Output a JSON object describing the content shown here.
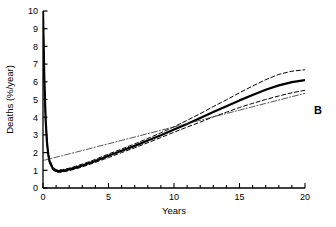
{
  "panel": {
    "label": "B"
  },
  "chart_data": {
    "type": "line",
    "title": "",
    "xlabel": "Years",
    "ylabel": "Deaths (%/year)",
    "xlim": [
      0,
      20
    ],
    "ylim": [
      0,
      10
    ],
    "grid": false,
    "legend_position": "none",
    "xticks": [
      0,
      5,
      10,
      15,
      20
    ],
    "xtick_labels": [
      "0",
      "5",
      "10",
      "15",
      "20"
    ],
    "xminor_tick_interval": 1,
    "yticks": [
      0,
      1,
      2,
      3,
      4,
      5,
      6,
      7,
      8,
      9,
      10
    ],
    "ytick_labels": [
      "0",
      "1",
      "2",
      "3",
      "4",
      "5",
      "6",
      "7",
      "8",
      "9",
      "10"
    ],
    "x": [
      0,
      0.1,
      0.2,
      0.3,
      0.4,
      0.5,
      0.75,
      1,
      1.25,
      1.5,
      2,
      2.5,
      3,
      3.5,
      4,
      5,
      6,
      7,
      8,
      9,
      10,
      11,
      12,
      13,
      14,
      15,
      16,
      17,
      18,
      19,
      20
    ],
    "series": [
      {
        "name": "Hazard estimate",
        "style": "solid",
        "width": 2.2,
        "color": "#000000",
        "values": [
          10.0,
          6.2,
          3.9,
          2.6,
          1.9,
          1.5,
          1.1,
          0.97,
          0.95,
          0.97,
          1.05,
          1.15,
          1.27,
          1.4,
          1.53,
          1.82,
          2.1,
          2.38,
          2.68,
          2.98,
          3.3,
          3.62,
          3.95,
          4.3,
          4.62,
          4.95,
          5.25,
          5.55,
          5.8,
          5.98,
          6.1
        ]
      },
      {
        "name": "Upper 95% confidence band",
        "style": "dashed",
        "width": 1.0,
        "color": "#000000",
        "values": [
          10.0,
          6.35,
          4.05,
          2.72,
          2.0,
          1.6,
          1.18,
          1.04,
          1.02,
          1.04,
          1.12,
          1.23,
          1.35,
          1.48,
          1.62,
          1.92,
          2.2,
          2.49,
          2.8,
          3.12,
          3.46,
          3.82,
          4.2,
          4.6,
          4.98,
          5.38,
          5.76,
          6.12,
          6.42,
          6.6,
          6.68
        ]
      },
      {
        "name": "Lower 95% confidence band",
        "style": "dashed",
        "width": 1.0,
        "color": "#000000",
        "values": [
          10.0,
          6.05,
          3.78,
          2.5,
          1.82,
          1.42,
          1.04,
          0.9,
          0.88,
          0.9,
          0.98,
          1.08,
          1.19,
          1.32,
          1.45,
          1.72,
          2.0,
          2.27,
          2.56,
          2.85,
          3.15,
          3.44,
          3.72,
          4.02,
          4.28,
          4.55,
          4.78,
          5.0,
          5.2,
          5.38,
          5.52
        ]
      },
      {
        "name": "Reference line",
        "style": "dash-dot",
        "width": 0.9,
        "color": "#444444",
        "values": [
          1.55,
          1.57,
          1.59,
          1.61,
          1.63,
          1.65,
          1.69,
          1.74,
          1.79,
          1.83,
          1.93,
          2.02,
          2.12,
          2.21,
          2.31,
          2.5,
          2.69,
          2.88,
          3.07,
          3.26,
          3.45,
          3.64,
          3.83,
          4.02,
          4.21,
          4.4,
          4.59,
          4.78,
          4.97,
          5.16,
          5.35
        ]
      }
    ]
  }
}
